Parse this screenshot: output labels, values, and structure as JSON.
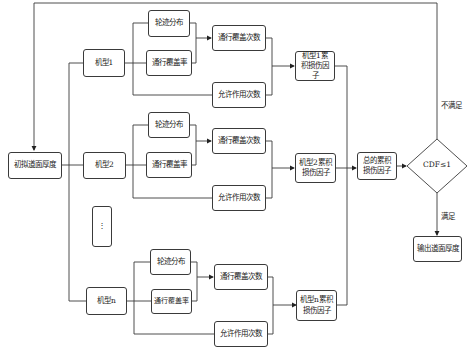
{
  "start": {
    "label": "初拟道面厚度"
  },
  "aircraft": [
    {
      "label": "机型1",
      "wheel": "轮迹分布",
      "coverage_rate": "通行覆盖率",
      "coverage_count": "通行覆盖次数",
      "allowed": "允许作用次数",
      "damage": "机型1累积损伤因子"
    },
    {
      "label": "机型2",
      "wheel": "轮迹分布",
      "coverage_rate": "通行覆盖率",
      "coverage_count": "通行覆盖次数",
      "allowed": "允许作用次数",
      "damage": "机型2累积损伤因子"
    },
    {
      "label": "机型n",
      "wheel": "轮迹分布",
      "coverage_rate": "通行覆盖率",
      "coverage_count": "通行覆盖次数",
      "allowed": "允许作用次数",
      "damage": "机型n累积损伤因子"
    }
  ],
  "ellipsis": {
    "label": "⋮"
  },
  "total": {
    "label": "总的累积损伤因子"
  },
  "decision": {
    "label": "CDF≤1",
    "no": "不满足",
    "yes": "满足"
  },
  "output": {
    "label": "输出道面厚度"
  },
  "colors": {
    "stroke": "#3a3a3a",
    "text": "#222222",
    "background": "#ffffff"
  }
}
